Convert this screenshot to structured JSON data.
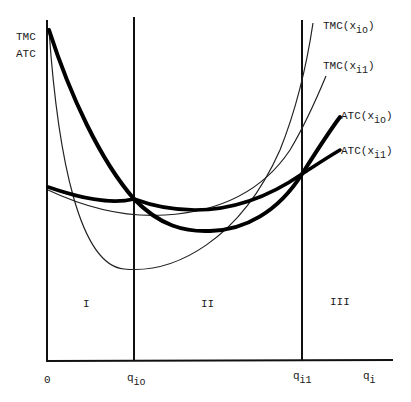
{
  "diagram": {
    "type": "cost-curves",
    "axes": {
      "y_label_line1": "TMC",
      "y_label_line2": "ATC",
      "origin_label": "0",
      "x_label_main": "q",
      "x_label_sub": "i"
    },
    "x_markers": [
      {
        "main": "q",
        "sub": "io"
      },
      {
        "main": "q",
        "sub": "i1"
      }
    ],
    "regions": [
      {
        "label": "I"
      },
      {
        "label": "II"
      },
      {
        "label": "III"
      }
    ],
    "curves": [
      {
        "prefix": "TMC(x",
        "sub": "io",
        "suffix": ")",
        "style": "thin"
      },
      {
        "prefix": "TMC(x",
        "sub": "i1",
        "suffix": ")",
        "style": "thin"
      },
      {
        "prefix": "ATC(x",
        "sub": "io",
        "suffix": ")",
        "style": "thick"
      },
      {
        "prefix": "ATC(x",
        "sub": "i1",
        "suffix": ")",
        "style": "thick"
      }
    ],
    "colors": {
      "line": "#111111",
      "background": "#ffffff"
    }
  }
}
